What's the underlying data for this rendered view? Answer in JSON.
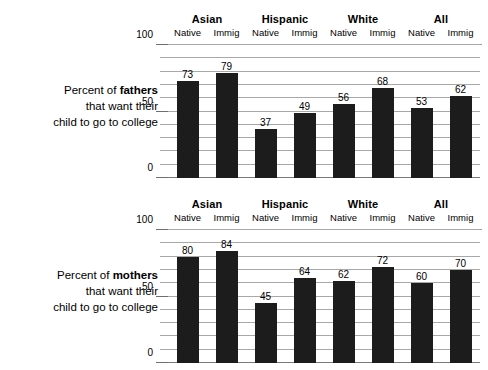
{
  "chart_data": [
    {
      "type": "bar",
      "title": "Percent of fathers that want their child to go to college",
      "caption_line1_prefix": "Percent of ",
      "caption_line1_bold": "fathers",
      "caption_line2": "that want their",
      "caption_line3": "child to go to college",
      "categories": [
        "Asian",
        "Hispanic",
        "White",
        "All"
      ],
      "subcategories": [
        "Native",
        "Immig"
      ],
      "series": [
        {
          "name": "Native",
          "values": [
            73,
            37,
            56,
            53
          ]
        },
        {
          "name": "Immig",
          "values": [
            79,
            49,
            68,
            62
          ]
        }
      ],
      "bars": [
        {
          "group": "Asian",
          "sub": "Native",
          "value": 73
        },
        {
          "group": "Asian",
          "sub": "Immig",
          "value": 79
        },
        {
          "group": "Hispanic",
          "sub": "Native",
          "value": 37
        },
        {
          "group": "Hispanic",
          "sub": "Immig",
          "value": 49
        },
        {
          "group": "White",
          "sub": "Native",
          "value": 56
        },
        {
          "group": "White",
          "sub": "Immig",
          "value": 68
        },
        {
          "group": "All",
          "sub": "Native",
          "value": 53
        },
        {
          "group": "All",
          "sub": "Immig",
          "value": 62
        }
      ],
      "ylim": [
        0,
        100
      ],
      "ytick_labels": [
        "100",
        "50",
        "0"
      ],
      "ytick_values": [
        100,
        50,
        0
      ],
      "gridline_interval": 10,
      "grid": true,
      "legend": "none",
      "xlabel": "",
      "ylabel": "",
      "bar_color": "#1c1c1c"
    },
    {
      "type": "bar",
      "title": "Percent of mothers that want their child to go to college",
      "caption_line1_prefix": "Percent of ",
      "caption_line1_bold": "mothers",
      "caption_line2": "that want their",
      "caption_line3": "child to go to college",
      "categories": [
        "Asian",
        "Hispanic",
        "White",
        "All"
      ],
      "subcategories": [
        "Native",
        "Immig"
      ],
      "series": [
        {
          "name": "Native",
          "values": [
            80,
            45,
            62,
            60
          ]
        },
        {
          "name": "Immig",
          "values": [
            84,
            64,
            72,
            70
          ]
        }
      ],
      "bars": [
        {
          "group": "Asian",
          "sub": "Native",
          "value": 80
        },
        {
          "group": "Asian",
          "sub": "Immig",
          "value": 84
        },
        {
          "group": "Hispanic",
          "sub": "Native",
          "value": 45
        },
        {
          "group": "Hispanic",
          "sub": "Immig",
          "value": 64
        },
        {
          "group": "White",
          "sub": "Native",
          "value": 62
        },
        {
          "group": "White",
          "sub": "Immig",
          "value": 72
        },
        {
          "group": "All",
          "sub": "Native",
          "value": 60
        },
        {
          "group": "All",
          "sub": "Immig",
          "value": 70
        }
      ],
      "ylim": [
        0,
        100
      ],
      "ytick_labels": [
        "100",
        "50",
        "0"
      ],
      "ytick_values": [
        100,
        50,
        0
      ],
      "gridline_interval": 10,
      "grid": true,
      "legend": "none",
      "xlabel": "",
      "ylabel": "",
      "bar_color": "#1c1c1c"
    }
  ]
}
